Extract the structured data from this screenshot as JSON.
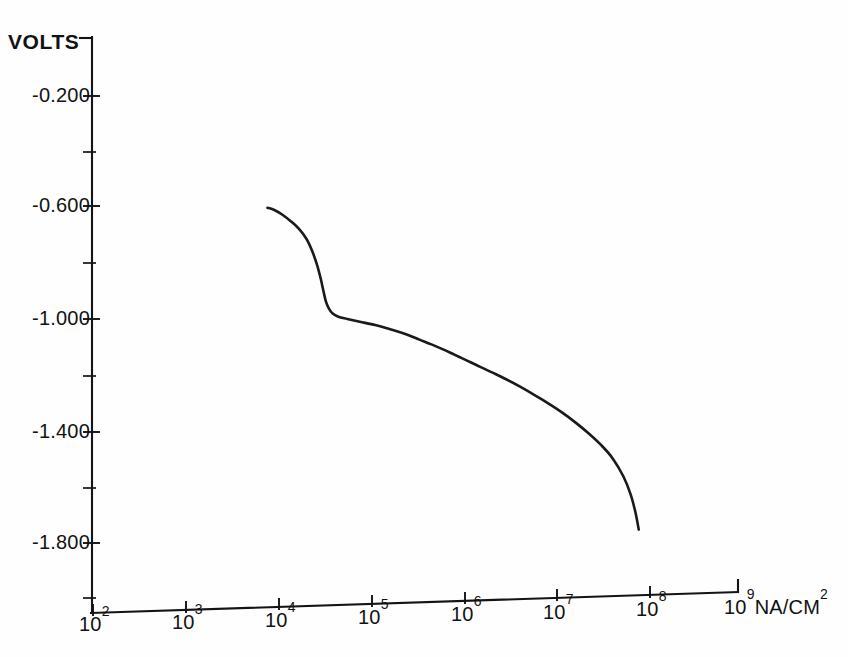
{
  "chart_data": {
    "type": "line",
    "title": "",
    "xlabel": "NA/CM2",
    "ylabel": "VOLTS",
    "xscale": "log",
    "yscale": "linear",
    "grid": false,
    "legend": false,
    "xlim": [
      100,
      1000000000
    ],
    "ylim": [
      -2.0,
      0.0
    ],
    "x_tick_labels": [
      "10²",
      "10³",
      "10⁴",
      "10⁵",
      "10⁶",
      "10⁷",
      "10⁸",
      "10⁹"
    ],
    "x_tick_mantissa": "10",
    "x_tick_exponents": [
      "2",
      "3",
      "4",
      "5",
      "6",
      "7",
      "8",
      "9"
    ],
    "x_tick_values": [
      100,
      1000,
      10000,
      100000,
      1000000,
      10000000,
      100000000,
      1000000000
    ],
    "y_tick_labels": [
      "-0.200",
      "-0.600",
      "-1.000",
      "-1.400",
      "-1.800"
    ],
    "y_tick_values": [
      -0.2,
      -0.6,
      -1.0,
      -1.4,
      -1.8
    ],
    "y_minor_tick_values": [
      -0.4,
      -0.8,
      -1.2,
      -1.6,
      -2.0
    ],
    "series": [
      {
        "name": "polarization",
        "color": "#1a1a1a",
        "x": [
          7600,
          9000,
          11000,
          13500,
          16500,
          20000,
          23000,
          26000,
          28500,
          30500,
          32500,
          35000,
          38000,
          44000,
          55000,
          75000,
          110000,
          150000,
          200000,
          260000,
          330000,
          450000,
          700000,
          1200000,
          2200000,
          4000000,
          7000000,
          11000000,
          16000000,
          22000000,
          30000000,
          40000000,
          52000000,
          62000000,
          70000000,
          76000000
        ],
        "y": [
          -0.6,
          -0.608,
          -0.625,
          -0.648,
          -0.675,
          -0.712,
          -0.755,
          -0.805,
          -0.855,
          -0.9,
          -0.938,
          -0.962,
          -0.978,
          -0.99,
          -0.998,
          -1.008,
          -1.02,
          -1.032,
          -1.045,
          -1.058,
          -1.072,
          -1.09,
          -1.118,
          -1.155,
          -1.196,
          -1.24,
          -1.288,
          -1.33,
          -1.37,
          -1.408,
          -1.45,
          -1.498,
          -1.562,
          -1.625,
          -1.69,
          -1.752
        ],
        "units_x": "NA/CM2",
        "units_y": "VOLTS"
      }
    ]
  },
  "axes": {
    "y_axis_title": "VOLTS",
    "x_axis_unit_mantissa": "NA/CM",
    "x_axis_unit_exponent": "2"
  }
}
